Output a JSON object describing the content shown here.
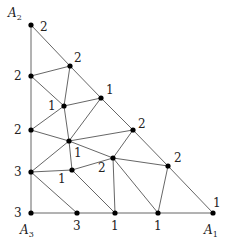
{
  "diagram": {
    "corners": [
      {
        "name": "A",
        "sub": "2",
        "x": 8,
        "y": 17
      },
      {
        "name": "A",
        "sub": "3",
        "x": 20,
        "y": 234
      },
      {
        "name": "A",
        "sub": "1",
        "x": 204,
        "y": 234
      }
    ],
    "vertices": [
      {
        "id": "A2",
        "x": 31,
        "y": 25,
        "label": "2",
        "lx": 40,
        "ly": 31
      },
      {
        "id": "P1",
        "x": 70,
        "y": 66,
        "label": "2",
        "lx": 74,
        "ly": 62
      },
      {
        "id": "P2",
        "x": 31,
        "y": 76,
        "label": "2",
        "lx": 14,
        "ly": 80
      },
      {
        "id": "P3",
        "x": 64,
        "y": 106,
        "label": "1",
        "lx": 48,
        "ly": 110
      },
      {
        "id": "P4",
        "x": 101,
        "y": 98,
        "label": "1",
        "lx": 106,
        "ly": 94
      },
      {
        "id": "P5",
        "x": 31,
        "y": 130,
        "label": "2",
        "lx": 14,
        "ly": 134
      },
      {
        "id": "P6",
        "x": 69,
        "y": 141,
        "label": "1",
        "lx": 74,
        "ly": 157
      },
      {
        "id": "P7",
        "x": 133,
        "y": 130,
        "label": "2",
        "lx": 138,
        "ly": 128
      },
      {
        "id": "P8",
        "x": 31,
        "y": 172,
        "label": "3",
        "lx": 14,
        "ly": 176
      },
      {
        "id": "P9",
        "x": 72,
        "y": 170,
        "label": "1",
        "lx": 58,
        "ly": 183
      },
      {
        "id": "P10",
        "x": 113,
        "y": 158,
        "label": "2",
        "lx": 98,
        "ly": 172
      },
      {
        "id": "P11",
        "x": 168,
        "y": 166,
        "label": "2",
        "lx": 174,
        "ly": 162
      },
      {
        "id": "A3",
        "x": 31,
        "y": 213,
        "label": "3",
        "lx": 14,
        "ly": 217
      },
      {
        "id": "B1",
        "x": 77,
        "y": 213,
        "label": "3",
        "lx": 73,
        "ly": 230
      },
      {
        "id": "B2",
        "x": 115,
        "y": 213,
        "label": "1",
        "lx": 111,
        "ly": 230
      },
      {
        "id": "B3",
        "x": 158,
        "y": 213,
        "label": "1",
        "lx": 154,
        "ly": 230
      },
      {
        "id": "A1",
        "x": 213,
        "y": 213,
        "label": "1",
        "lx": 213,
        "ly": 207
      }
    ],
    "edges": [
      [
        "A2",
        "P2"
      ],
      [
        "P2",
        "P5"
      ],
      [
        "P5",
        "P8"
      ],
      [
        "P8",
        "A3"
      ],
      [
        "A3",
        "B1"
      ],
      [
        "B1",
        "B2"
      ],
      [
        "B2",
        "B3"
      ],
      [
        "B3",
        "A1"
      ],
      [
        "A2",
        "P1"
      ],
      [
        "P1",
        "P4"
      ],
      [
        "P4",
        "P7"
      ],
      [
        "P7",
        "P11"
      ],
      [
        "P11",
        "A1"
      ],
      [
        "P2",
        "P1"
      ],
      [
        "P1",
        "P3"
      ],
      [
        "P2",
        "P3"
      ],
      [
        "P3",
        "P4"
      ],
      [
        "P3",
        "P5"
      ],
      [
        "P3",
        "P6"
      ],
      [
        "P4",
        "P6"
      ],
      [
        "P5",
        "P6"
      ],
      [
        "P6",
        "P7"
      ],
      [
        "P6",
        "P8"
      ],
      [
        "P6",
        "P9"
      ],
      [
        "P6",
        "P10"
      ],
      [
        "P8",
        "P9"
      ],
      [
        "P8",
        "B1"
      ],
      [
        "P9",
        "B2"
      ],
      [
        "P9",
        "P10"
      ],
      [
        "P10",
        "B2"
      ],
      [
        "P7",
        "P10"
      ],
      [
        "P10",
        "P11"
      ],
      [
        "P10",
        "B3"
      ],
      [
        "P11",
        "B3"
      ]
    ]
  }
}
